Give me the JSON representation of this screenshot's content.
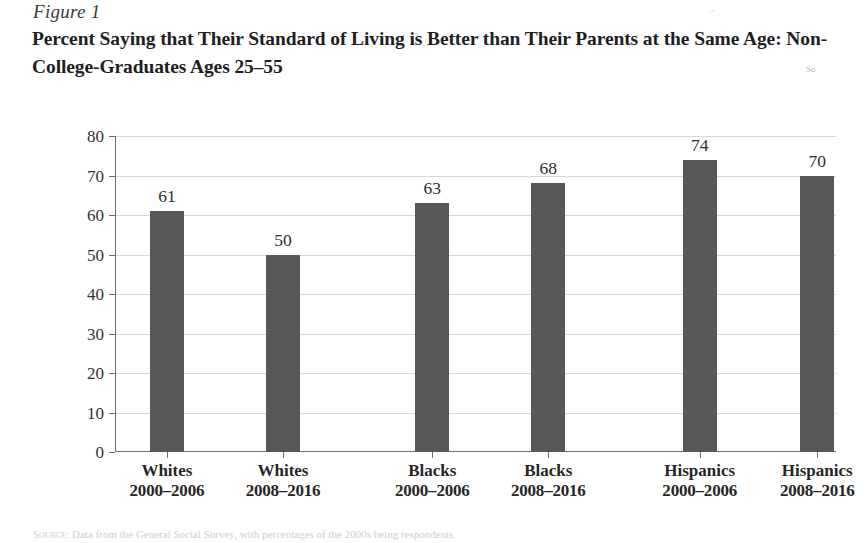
{
  "figure": {
    "label": "Figure 1",
    "title": "Percent Saying that Their Standard of Living is Better than Their Parents at the Same Age: Non-College-Graduates Ages 25–55"
  },
  "marginalia": {
    "speck_top": "··",
    "speck_mid": "So"
  },
  "source_note": {
    "prefix": "Source:",
    "text": "Data from the General Social Survey, with percentages of the 2000s being respondents"
  },
  "chart_data": {
    "type": "bar",
    "title": "Percent Saying that Their Standard of Living is Better than Their Parents at the Same Age: Non-College-Graduates Ages 25–55",
    "xlabel": "",
    "ylabel": "",
    "ylim": [
      0,
      80
    ],
    "ytick_step": 10,
    "yticks": [
      "0",
      "10",
      "20",
      "30",
      "40",
      "50",
      "60",
      "70",
      "80"
    ],
    "grid": true,
    "legend": "none",
    "bar_color": "#575757",
    "gridline_color": "#d8d8d8",
    "axis_color": "#6f6f6f",
    "categories": [
      {
        "name": "Whites",
        "period": "2000–2006",
        "center_pct": 7.2
      },
      {
        "name": "Whites",
        "period": "2008–2016",
        "center_pct": 23.3
      },
      {
        "name": "Blacks",
        "period": "2000–2006",
        "center_pct": 44.0
      },
      {
        "name": "Blacks",
        "period": "2008–2016",
        "center_pct": 60.1
      },
      {
        "name": "Hispanics",
        "period": "2000–2006",
        "center_pct": 81.1
      },
      {
        "name": "Hispanics",
        "period": "2008–2016",
        "center_pct": 97.4
      }
    ],
    "values": [
      61,
      50,
      63,
      68,
      74,
      70
    ],
    "value_labels": [
      "61",
      "50",
      "63",
      "68",
      "74",
      "70"
    ]
  }
}
